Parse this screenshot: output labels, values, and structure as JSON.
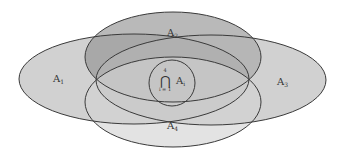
{
  "diagram": {
    "type": "venn",
    "sets": [
      {
        "id": "A1",
        "label": "A",
        "subscript": "1",
        "cx": 134,
        "cy": 79,
        "rx": 115,
        "ry": 45,
        "fill": "#b4b4b4"
      },
      {
        "id": "A2",
        "label": "A",
        "subscript": "2",
        "cx": 173,
        "cy": 57,
        "rx": 88,
        "ry": 45,
        "fill": "#8e8e8e"
      },
      {
        "id": "A3",
        "label": "A",
        "subscript": "3",
        "cx": 211,
        "cy": 80,
        "rx": 115,
        "ry": 45,
        "fill": "#b4b4b4"
      },
      {
        "id": "A4",
        "label": "A",
        "subscript": "4",
        "cx": 173,
        "cy": 102,
        "rx": 88,
        "ry": 45,
        "fill": "#d2d2d2"
      }
    ],
    "intersection": {
      "symbol": "⋂",
      "upper_index": "4",
      "lower_index": "i = 1",
      "label": "A",
      "subscript": "i",
      "cx": 172,
      "cy": 83,
      "r": 23
    },
    "stroke_color": "#3a3a3a",
    "background": "#ffffff"
  }
}
